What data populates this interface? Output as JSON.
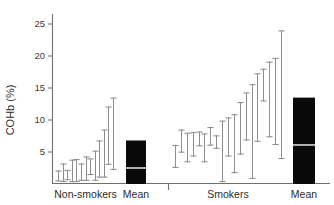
{
  "chart_data": {
    "type": "bar",
    "title": "",
    "subtitle": "",
    "xlabel": "",
    "ylabel": "COHb (%)",
    "ylim": [
      0,
      27.5
    ],
    "yticks": [
      5,
      10,
      15,
      20,
      25
    ],
    "ytick_labels": [
      "5",
      "10",
      "15",
      "20",
      "25"
    ],
    "grid": false,
    "legend": "none",
    "groups": [
      {
        "name": "Non-smokers",
        "label": "Non-smokers",
        "type": "range-bars",
        "series_name": "Individual non-smokers",
        "ranges": [
          {
            "id": "ns-1",
            "low": 0.4,
            "high": 2.1
          },
          {
            "id": "ns-2",
            "low": 0.3,
            "high": 3.2
          },
          {
            "id": "ns-3",
            "low": 0.6,
            "high": 2.2
          },
          {
            "id": "ns-4",
            "low": 0.3,
            "high": 3.8
          },
          {
            "id": "ns-5",
            "low": 0.3,
            "high": 3.9
          },
          {
            "id": "ns-6",
            "low": 0.5,
            "high": 3.2
          },
          {
            "id": "ns-7",
            "low": 0.5,
            "high": 4.3
          },
          {
            "id": "ns-8",
            "low": 1.4,
            "high": 4.0
          },
          {
            "id": "ns-9",
            "low": 0.5,
            "high": 5.2
          },
          {
            "id": "ns-10",
            "low": 1.0,
            "high": 6.8
          },
          {
            "id": "ns-11",
            "low": 1.0,
            "high": 8.5
          },
          {
            "id": "ns-12",
            "low": 3.0,
            "high": 12.1
          },
          {
            "id": "ns-13",
            "low": 2.2,
            "high": 13.5
          }
        ]
      },
      {
        "name": "Non-smokers Mean",
        "label": "Mean",
        "type": "mean-box",
        "box_top": 6.8,
        "box_bottom": 0,
        "mean_value": 2.5
      },
      {
        "name": "Smokers",
        "label": "Smokers",
        "type": "range-bars",
        "series_name": "Individual smokers",
        "ranges": [
          {
            "id": "sm-1",
            "low": 2.5,
            "high": 6.1
          },
          {
            "id": "sm-2",
            "low": 4.9,
            "high": 8.5
          },
          {
            "id": "sm-3",
            "low": 3.4,
            "high": 8.0
          },
          {
            "id": "sm-4",
            "low": 4.3,
            "high": 8.1
          },
          {
            "id": "sm-5",
            "low": 5.9,
            "high": 8.2
          },
          {
            "id": "sm-6",
            "low": 3.4,
            "high": 7.9
          },
          {
            "id": "sm-7",
            "low": 6.0,
            "high": 8.9
          },
          {
            "id": "sm-8",
            "low": 5.5,
            "high": 7.6
          },
          {
            "id": "sm-9",
            "low": 0.3,
            "high": 9.9
          },
          {
            "id": "sm-10",
            "low": 4.3,
            "high": 10.4
          },
          {
            "id": "sm-11",
            "low": 1.7,
            "high": 10.9
          },
          {
            "id": "sm-12",
            "low": 4.6,
            "high": 12.8
          },
          {
            "id": "sm-13",
            "low": 6.8,
            "high": 14.3
          },
          {
            "id": "sm-14",
            "low": 0.8,
            "high": 15.6
          },
          {
            "id": "sm-15",
            "low": 6.6,
            "high": 17.3
          },
          {
            "id": "sm-16",
            "low": 12.9,
            "high": 18.0
          },
          {
            "id": "sm-17",
            "low": 7.3,
            "high": 19.1
          },
          {
            "id": "sm-18",
            "low": 6.1,
            "high": 19.7
          },
          {
            "id": "sm-19",
            "low": 3.9,
            "high": 24.0
          }
        ]
      },
      {
        "name": "Smokers Mean",
        "label": "Mean",
        "type": "mean-box",
        "box_top": 13.5,
        "box_bottom": 0,
        "mean_value": 6.1
      }
    ],
    "colors": {
      "range_bar": "#8d8d8d",
      "mean_box": "#0a0a0a",
      "mean_divider": "#d8d8d8",
      "axis": "#6f6f6f",
      "text": "#2b2b2b",
      "background": "#ffffff"
    }
  },
  "axis": {
    "y_label": "COHb (%)"
  }
}
